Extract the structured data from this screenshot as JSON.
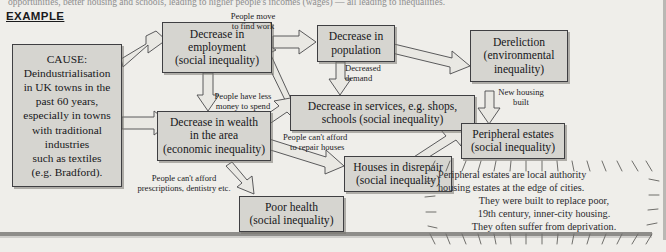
{
  "page": {
    "top_cutoff_text": "opportunities, better housing and schools, leading to higher people's incomes (wages) — all leading to inequalities.",
    "section_heading": "EXAMPLE"
  },
  "colors": {
    "box_fill": "#d6d5d0",
    "box_border": "#3f3f42",
    "arrow_fill": "#e9e8e3",
    "arrow_border": "#4a4a4c",
    "page_bg": "#efeeea",
    "rule": "#8e8d8a"
  },
  "boxes": [
    {
      "id": "cause",
      "name": "cause-box",
      "text": "CAUSE: Deindustrialisation in UK towns in the past 60 years, especially in towns with traditional industries such as textiles (e.g. Bradford)."
    },
    {
      "id": "employment",
      "name": "decrease-in-employment-box",
      "text": "Decrease in employment (social inequality)"
    },
    {
      "id": "population",
      "name": "decrease-in-population-box",
      "text": "Decrease in population"
    },
    {
      "id": "dereliction",
      "name": "dereliction-box",
      "text": "Dereliction (environmental inequality)"
    },
    {
      "id": "services",
      "name": "decrease-in-services-box",
      "text": "Decrease in services, e.g. shops, schools (social inequality)"
    },
    {
      "id": "wealth",
      "name": "decrease-in-wealth-box",
      "text": "Decrease in wealth in the area (economic inequality)"
    },
    {
      "id": "estates",
      "name": "peripheral-estates-box",
      "text": "Peripheral estates (social inequality)"
    },
    {
      "id": "disrepair",
      "name": "houses-in-disrepair-box",
      "text": "Houses in disrepair (social inequality)"
    },
    {
      "id": "health",
      "name": "poor-health-box",
      "text": "Poor health (social inequality)"
    }
  ],
  "box_text": {
    "cause": {
      "l1": "CAUSE:",
      "l2": "Deindustrialisation",
      "l3": "in UK towns in the",
      "l4": "past 60 years,",
      "l5": "especially in towns",
      "l6": "with traditional",
      "l7": "industries",
      "l8": "such as textiles",
      "l9": "(e.g. Bradford)."
    },
    "employment": {
      "l1": "Decrease in",
      "l2": "employment",
      "l3": "(social inequality)"
    },
    "population": {
      "l1": "Decrease in",
      "l2": "population"
    },
    "dereliction": {
      "l1": "Dereliction",
      "l2": "(environmental",
      "l3": "inequality)"
    },
    "services": {
      "l1": "Decrease in services, e.g. shops,",
      "l2": "schools (social inequality)"
    },
    "wealth": {
      "l1": "Decrease in wealth",
      "l2": "in the area",
      "l3": "(economic inequality)"
    },
    "estates": {
      "l1": "Peripheral estates",
      "l2": "(social inequality)"
    },
    "disrepair": {
      "l1": "Houses in disrepair",
      "l2": "(social inequality)"
    },
    "health": {
      "l1": "Poor health",
      "l2": "(social inequality)"
    }
  },
  "link_labels": {
    "move_to_find_work": {
      "l1": "People move",
      "l2": "to find work"
    },
    "decreased_demand": {
      "l1": "Decreased",
      "l2": "demand"
    },
    "new_housing_built": {
      "l1": "New housing",
      "l2": "built"
    },
    "less_money": {
      "l1": "People have less",
      "l2": "money to spend"
    },
    "cant_afford_repair": {
      "l1": "People can't afford",
      "l2": "to repair houses"
    },
    "cant_afford_prescriptions": {
      "l1": "People can't afford",
      "l2": "prescriptions, dentistry etc."
    }
  },
  "note": {
    "l1": "Peripheral estates are local authority",
    "l2": "housing estates at the edge of cities.",
    "l3": "They were built to replace poor,",
    "l4": "19th century, inner-city housing.",
    "l5": "They often suffer from deprivation."
  },
  "connections": [
    {
      "from": "cause",
      "to": "employment",
      "label": null
    },
    {
      "from": "cause",
      "to": "wealth",
      "label": null
    },
    {
      "from": "employment",
      "to": "population",
      "label": "move_to_find_work"
    },
    {
      "from": "employment",
      "to": "wealth",
      "label": null
    },
    {
      "from": "population",
      "to": "dereliction",
      "label": null
    },
    {
      "from": "population",
      "to": "services",
      "label": "decreased_demand"
    },
    {
      "from": "wealth",
      "to": "services",
      "label": "less_money"
    },
    {
      "from": "services",
      "to": "employment",
      "label": null
    },
    {
      "from": "dereliction",
      "to": "estates",
      "label": "new_housing_built"
    },
    {
      "from": "wealth",
      "to": "disrepair",
      "label": "cant_afford_repair"
    },
    {
      "from": "wealth",
      "to": "health",
      "label": "cant_afford_prescriptions"
    },
    {
      "from": "disrepair",
      "to": "estates",
      "label": null
    }
  ]
}
